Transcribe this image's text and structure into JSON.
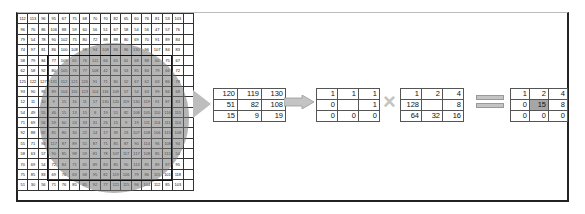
{
  "diagram": {
    "grid": {
      "rows": [
        [
          112,
          113,
          96,
          95,
          67,
          75,
          68,
          70,
          70,
          82,
          65,
          60,
          76,
          81,
          53,
          103,
          0
        ],
        [
          96,
          76,
          86,
          106,
          88,
          59,
          60,
          56,
          51,
          67,
          58,
          54,
          56,
          47,
          57,
          76,
          0
        ],
        [
          79,
          54,
          78,
          90,
          102,
          75,
          80,
          72,
          88,
          88,
          80,
          69,
          70,
          91,
          89,
          84,
          0
        ],
        [
          74,
          97,
          81,
          86,
          100,
          108,
          98,
          94,
          108,
          86,
          86,
          130,
          96,
          107,
          84,
          83,
          0
        ],
        [
          58,
          79,
          84,
          77,
          109,
          65,
          76,
          111,
          66,
          65,
          61,
          68,
          88,
          60,
          75,
          67,
          0
        ],
        [
          62,
          58,
          92,
          80,
          105,
          78,
          77,
          108,
          42,
          86,
          53,
          85,
          84,
          79,
          66,
          72,
          0
        ],
        [
          125,
          122,
          127,
          131,
          112,
          121,
          126,
          91,
          71,
          80,
          52,
          67,
          62,
          63,
          86,
          78,
          0
        ],
        [
          93,
          90,
          95,
          89,
          104,
          116,
          123,
          114,
          116,
          109,
          57,
          54,
          63,
          99,
          84,
          68,
          0
        ],
        [
          12,
          11,
          10,
          9,
          15,
          16,
          11,
          17,
          130,
          120,
          119,
          130,
          119,
          91,
          87,
          83,
          0
        ],
        [
          54,
          49,
          55,
          46,
          15,
          13,
          15,
          8,
          19,
          51,
          82,
          108,
          105,
          110,
          116,
          115,
          0
        ],
        [
          71,
          69,
          56,
          59,
          60,
          24,
          33,
          31,
          26,
          15,
          9,
          19,
          111,
          114,
          111,
          114,
          0
        ],
        [
          92,
          88,
          82,
          81,
          80,
          30,
          22,
          14,
          17,
          39,
          23,
          107,
          108,
          106,
          115,
          108,
          0
        ],
        [
          55,
          71,
          94,
          117,
          87,
          89,
          51,
          87,
          71,
          85,
          87,
          90,
          114,
          96,
          108,
          94,
          0
        ],
        [
          58,
          63,
          57,
          90,
          85,
          98,
          59,
          81,
          78,
          107,
          117,
          117,
          108,
          85,
          115,
          54,
          0
        ],
        [
          70,
          69,
          54,
          72,
          84,
          71,
          65,
          89,
          83,
          85,
          90,
          113,
          85,
          89,
          87,
          95,
          0
        ],
        [
          75,
          85,
          83,
          69,
          76,
          63,
          68,
          95,
          82,
          119,
          106,
          79,
          86,
          115,
          101,
          118,
          0
        ],
        [
          51,
          30,
          56,
          71,
          76,
          85,
          85,
          92,
          77,
          121,
          115,
          96,
          104,
          112,
          85,
          103,
          0
        ]
      ]
    },
    "neighborhood": [
      [
        120,
        119,
        130
      ],
      [
        51,
        82,
        108
      ],
      [
        15,
        9,
        19
      ]
    ],
    "binary": [
      [
        "1",
        "1",
        "1"
      ],
      [
        "0",
        "",
        "1"
      ],
      [
        "0",
        "0",
        "0"
      ]
    ],
    "weights": [
      [
        "1",
        "2",
        "4"
      ],
      [
        "128",
        "",
        "8"
      ],
      [
        "64",
        "32",
        "16"
      ]
    ],
    "result": [
      [
        "1",
        "2",
        "4"
      ],
      [
        "0",
        "15",
        "8"
      ],
      [
        "0",
        "0",
        "0"
      ]
    ],
    "operators": {
      "multiply": "×",
      "equals": "="
    },
    "colors": {
      "highlight": "#a6a6a6",
      "arrow": "#bdbdbd",
      "shade": "#787878"
    }
  }
}
